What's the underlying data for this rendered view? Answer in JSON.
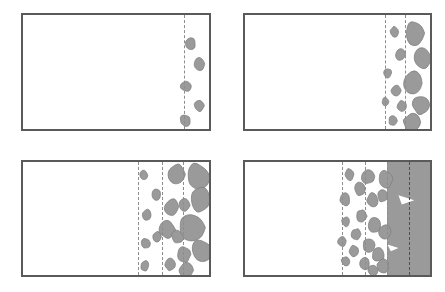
{
  "figure": {
    "title": "",
    "caption": "",
    "type": "schematic-sequence",
    "layout": {
      "rows": 2,
      "cols": 2,
      "width": 445,
      "height": 292
    },
    "colors": {
      "panel_border": "#5a5a5a",
      "blob_fill": "#9a9a9a",
      "blob_stroke": "#7d7d7d",
      "slab_fill": "#9a9a9a",
      "dash_line": "#8d8d8d",
      "dash_line_dark": "#4e4e4e",
      "background": "#ffffff"
    },
    "panels": [
      {
        "id": "panel-a",
        "label": "",
        "stage": 1,
        "box": {
          "x": 21,
          "y": 13,
          "w": 190,
          "h": 118
        },
        "front_lines": [
          0.868
        ],
        "slab": null,
        "blob_count": 5,
        "blobs": [
          {
            "cx": 0.9,
            "cy": 0.25,
            "rx": 0.03,
            "ry": 0.055
          },
          {
            "cx": 0.95,
            "cy": 0.43,
            "rx": 0.032,
            "ry": 0.058
          },
          {
            "cx": 0.878,
            "cy": 0.625,
            "rx": 0.03,
            "ry": 0.052
          },
          {
            "cx": 0.948,
            "cy": 0.795,
            "rx": 0.03,
            "ry": 0.055
          },
          {
            "cx": 0.872,
            "cy": 0.925,
            "rx": 0.03,
            "ry": 0.055
          }
        ]
      },
      {
        "id": "panel-b",
        "label": "",
        "stage": 2,
        "box": {
          "x": 243,
          "y": 13,
          "w": 189,
          "h": 118
        },
        "front_lines": [
          0.757,
          0.866
        ],
        "slab": null,
        "blob_count": 12,
        "blobs": [
          {
            "cx": 0.808,
            "cy": 0.15,
            "rx": 0.026,
            "ry": 0.052
          },
          {
            "cx": 0.92,
            "cy": 0.16,
            "rx": 0.06,
            "ry": 0.115
          },
          {
            "cx": 0.838,
            "cy": 0.35,
            "rx": 0.03,
            "ry": 0.058
          },
          {
            "cx": 0.958,
            "cy": 0.38,
            "rx": 0.052,
            "ry": 0.105
          },
          {
            "cx": 0.772,
            "cy": 0.51,
            "rx": 0.022,
            "ry": 0.045
          },
          {
            "cx": 0.905,
            "cy": 0.6,
            "rx": 0.058,
            "ry": 0.112
          },
          {
            "cx": 0.818,
            "cy": 0.665,
            "rx": 0.028,
            "ry": 0.052
          },
          {
            "cx": 0.76,
            "cy": 0.76,
            "rx": 0.02,
            "ry": 0.04
          },
          {
            "cx": 0.848,
            "cy": 0.8,
            "rx": 0.026,
            "ry": 0.05
          },
          {
            "cx": 0.955,
            "cy": 0.79,
            "rx": 0.048,
            "ry": 0.09
          },
          {
            "cx": 0.8,
            "cy": 0.93,
            "rx": 0.024,
            "ry": 0.046
          },
          {
            "cx": 0.905,
            "cy": 0.945,
            "rx": 0.05,
            "ry": 0.085
          }
        ]
      },
      {
        "id": "panel-c",
        "label": "",
        "stage": 3,
        "box": {
          "x": 21,
          "y": 160,
          "w": 190,
          "h": 117
        },
        "front_lines": [
          0.62,
          0.748,
          0.862
        ],
        "slab": null,
        "blob_count": 18,
        "blobs": [
          {
            "cx": 0.65,
            "cy": 0.12,
            "rx": 0.022,
            "ry": 0.045
          },
          {
            "cx": 0.83,
            "cy": 0.11,
            "rx": 0.048,
            "ry": 0.095
          },
          {
            "cx": 0.94,
            "cy": 0.13,
            "rx": 0.065,
            "ry": 0.125
          },
          {
            "cx": 0.718,
            "cy": 0.29,
            "rx": 0.026,
            "ry": 0.052
          },
          {
            "cx": 0.955,
            "cy": 0.33,
            "rx": 0.058,
            "ry": 0.115
          },
          {
            "cx": 0.8,
            "cy": 0.4,
            "rx": 0.038,
            "ry": 0.075
          },
          {
            "cx": 0.868,
            "cy": 0.385,
            "rx": 0.03,
            "ry": 0.06
          },
          {
            "cx": 0.665,
            "cy": 0.47,
            "rx": 0.026,
            "ry": 0.052
          },
          {
            "cx": 0.905,
            "cy": 0.58,
            "rx": 0.072,
            "ry": 0.14
          },
          {
            "cx": 0.775,
            "cy": 0.6,
            "rx": 0.042,
            "ry": 0.082
          },
          {
            "cx": 0.722,
            "cy": 0.66,
            "rx": 0.024,
            "ry": 0.048
          },
          {
            "cx": 0.83,
            "cy": 0.665,
            "rx": 0.032,
            "ry": 0.062
          },
          {
            "cx": 0.66,
            "cy": 0.72,
            "rx": 0.024,
            "ry": 0.048
          },
          {
            "cx": 0.958,
            "cy": 0.79,
            "rx": 0.055,
            "ry": 0.11
          },
          {
            "cx": 0.865,
            "cy": 0.82,
            "rx": 0.038,
            "ry": 0.075
          },
          {
            "cx": 0.79,
            "cy": 0.9,
            "rx": 0.03,
            "ry": 0.06
          },
          {
            "cx": 0.655,
            "cy": 0.92,
            "rx": 0.024,
            "ry": 0.048
          },
          {
            "cx": 0.88,
            "cy": 0.96,
            "rx": 0.04,
            "ry": 0.07
          }
        ]
      },
      {
        "id": "panel-d",
        "label": "",
        "stage": 4,
        "box": {
          "x": 243,
          "y": 160,
          "w": 189,
          "h": 117
        },
        "front_lines": [
          0.524,
          0.648,
          0.77
        ],
        "dark_front_line": 0.888,
        "slab": {
          "x_start": 0.77,
          "fill": "#9a9a9a"
        },
        "blob_count": 20,
        "blobs": [
          {
            "cx": 0.565,
            "cy": 0.11,
            "rx": 0.028,
            "ry": 0.055
          },
          {
            "cx": 0.665,
            "cy": 0.125,
            "rx": 0.036,
            "ry": 0.07
          },
          {
            "cx": 0.76,
            "cy": 0.155,
            "rx": 0.04,
            "ry": 0.078
          },
          {
            "cx": 0.62,
            "cy": 0.24,
            "rx": 0.03,
            "ry": 0.06
          },
          {
            "cx": 0.54,
            "cy": 0.33,
            "rx": 0.03,
            "ry": 0.06
          },
          {
            "cx": 0.69,
            "cy": 0.34,
            "rx": 0.034,
            "ry": 0.068
          },
          {
            "cx": 0.745,
            "cy": 0.3,
            "rx": 0.03,
            "ry": 0.058
          },
          {
            "cx": 0.628,
            "cy": 0.48,
            "rx": 0.03,
            "ry": 0.058
          },
          {
            "cx": 0.545,
            "cy": 0.53,
            "rx": 0.024,
            "ry": 0.048
          },
          {
            "cx": 0.7,
            "cy": 0.56,
            "rx": 0.036,
            "ry": 0.07
          },
          {
            "cx": 0.755,
            "cy": 0.62,
            "rx": 0.034,
            "ry": 0.066
          },
          {
            "cx": 0.6,
            "cy": 0.64,
            "rx": 0.026,
            "ry": 0.052
          },
          {
            "cx": 0.525,
            "cy": 0.7,
            "rx": 0.024,
            "ry": 0.048
          },
          {
            "cx": 0.67,
            "cy": 0.735,
            "rx": 0.032,
            "ry": 0.062
          },
          {
            "cx": 0.59,
            "cy": 0.79,
            "rx": 0.028,
            "ry": 0.055
          },
          {
            "cx": 0.72,
            "cy": 0.82,
            "rx": 0.034,
            "ry": 0.065
          },
          {
            "cx": 0.545,
            "cy": 0.88,
            "rx": 0.026,
            "ry": 0.05
          },
          {
            "cx": 0.645,
            "cy": 0.9,
            "rx": 0.03,
            "ry": 0.058
          },
          {
            "cx": 0.745,
            "cy": 0.925,
            "rx": 0.034,
            "ry": 0.066
          },
          {
            "cx": 0.69,
            "cy": 0.96,
            "rx": 0.028,
            "ry": 0.05
          }
        ],
        "voids": [
          {
            "cx": 0.87,
            "cy": 0.33,
            "r": 0.045,
            "shape": "triangle"
          },
          {
            "cx": 0.8,
            "cy": 0.76,
            "r": 0.03,
            "shape": "wedge"
          }
        ]
      }
    ]
  }
}
